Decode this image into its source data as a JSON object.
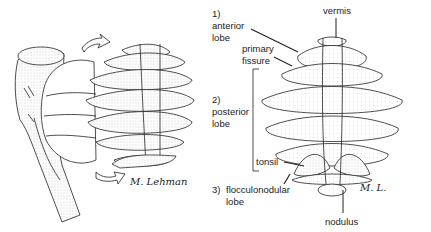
{
  "figure": {
    "left_panel": {
      "description": "Lateral view of brainstem with cerebellum, arrows indicating rotation to dorsal view",
      "signature": "M. Lehman"
    },
    "right_panel": {
      "description": "Unfolded cerebellum showing lobes",
      "signature": "M. L."
    }
  },
  "labels": {
    "vermis": "vermis",
    "anterior_num": "1)",
    "anterior_1": "anterior",
    "anterior_2": "lobe",
    "primary_1": "primary",
    "primary_2": "fissure",
    "posterior_num": "2)",
    "posterior_1": "posterior",
    "posterior_2": "lobe",
    "tonsil": "tonsil",
    "floccular_num": "3)",
    "floccular_1": "flocculonodular",
    "floccular_2": "lobe",
    "nodulus": "nodulus"
  },
  "colors": {
    "line": "#222222",
    "stipple": "#bfbfbf",
    "background": "#ffffff"
  }
}
